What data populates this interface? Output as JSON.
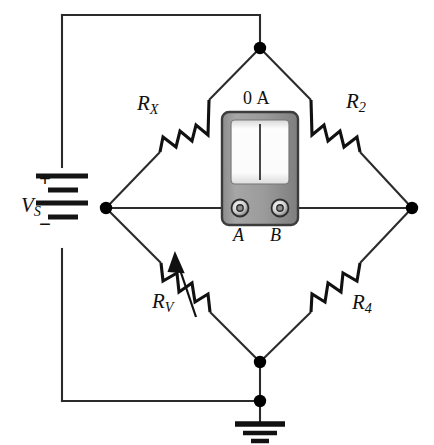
{
  "figure": {
    "background_color": "#ffffff",
    "wire_color": "#2b2b2b",
    "node_color": "#000000"
  },
  "source": {
    "symbol": "battery",
    "label": "V",
    "label_sub": "S",
    "plus_sign": "+",
    "minus_sign": "−"
  },
  "resistors": {
    "rx": {
      "label": "R",
      "label_sub": "X",
      "type": "fixed",
      "branch": "top-left"
    },
    "r2": {
      "label": "R",
      "label_sub": "2",
      "type": "fixed",
      "branch": "top-right"
    },
    "rv": {
      "label": "R",
      "label_sub": "V",
      "type": "variable",
      "branch": "bottom-left"
    },
    "r4": {
      "label": "R",
      "label_sub": "4",
      "type": "fixed",
      "branch": "bottom-right"
    }
  },
  "meter": {
    "type": "galvanometer",
    "reading": "0 A",
    "needle_position": "center-zero",
    "terminal_a": "A",
    "terminal_b": "B",
    "body_color": "#9a9a9a",
    "face_color": "#fbfbfb"
  },
  "ground": {
    "symbol": "earth-ground",
    "bars": 3
  },
  "nodes": [
    {
      "name": "top-node",
      "x": 260,
      "y": 48
    },
    {
      "name": "left-node",
      "x": 106,
      "y": 208
    },
    {
      "name": "right-node",
      "x": 412,
      "y": 208
    },
    {
      "name": "bottom-node",
      "x": 260,
      "y": 362
    },
    {
      "name": "ground-node",
      "x": 260,
      "y": 401
    }
  ]
}
